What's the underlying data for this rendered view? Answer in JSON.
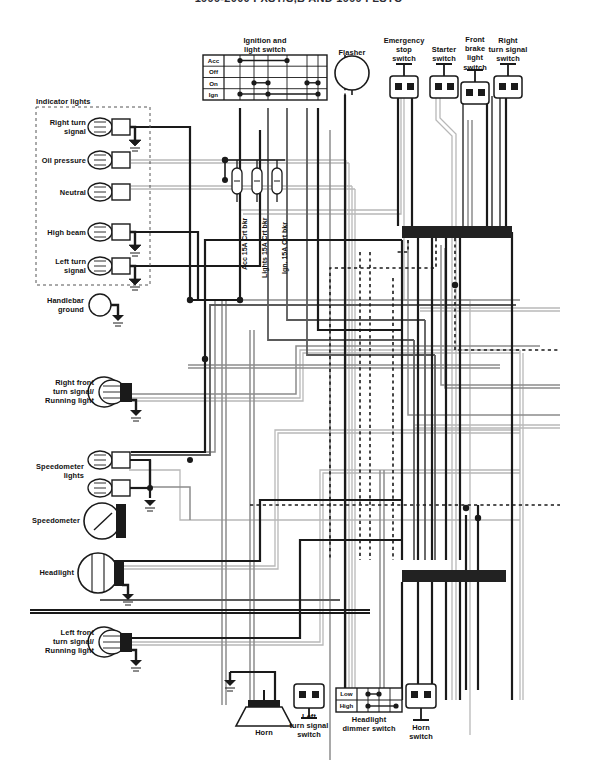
{
  "diagram": {
    "title": "1999-2000 FXST/S,B AND 1999 FLSTC",
    "type": "motorcycle-wiring-diagram",
    "width": 597,
    "height": 776
  },
  "colors": {
    "wire_black": "#1a1a1a",
    "wire_dark_gray": "#5a5a5a",
    "wire_mid_gray": "#8c8c8c",
    "wire_light_gray": "#b8b8b8",
    "connector_black": "#222222",
    "paper": "#ffffff",
    "title_gray": "#2b2b33"
  },
  "indicator_panel": {
    "title": "Indicator lights",
    "lamps": [
      {
        "label": "Right turn\nsignal",
        "grounded": true
      },
      {
        "label": "Oil pressure",
        "grounded": false
      },
      {
        "label": "Neutral",
        "grounded": false
      },
      {
        "label": "High beam",
        "grounded": true
      },
      {
        "label": "Left turn\nsignal",
        "grounded": true
      }
    ]
  },
  "ignition_switch": {
    "title": "Ignition and\nlight switch",
    "rows": [
      "Acc",
      "Off",
      "On",
      "Ign"
    ],
    "columns": 7,
    "contacts": {
      "Acc": [
        1,
        4
      ],
      "Off": [],
      "On": [
        2,
        3,
        6,
        7
      ],
      "Ign": [
        1,
        3,
        7
      ]
    }
  },
  "fuses": [
    {
      "label": "Acc 15A Crt bkr"
    },
    {
      "label": "Lights 15A Crt bkr"
    },
    {
      "label": "Ign. 15A Crt bkr"
    }
  ],
  "top_components": [
    {
      "label": "Flasher",
      "kind": "round"
    },
    {
      "label": "Emergency\nstop\nswitch",
      "kind": "2pin"
    },
    {
      "label": "Starter\nswitch",
      "kind": "2pin"
    },
    {
      "label": "Front\nbrake\nlight\nswitch",
      "kind": "2pin"
    },
    {
      "label": "Right\nturn signal\nswitch",
      "kind": "2pin"
    }
  ],
  "left_components": [
    {
      "label": "Handlebar\nground",
      "kind": "ground-circle"
    },
    {
      "label": "Right front\nturn signal/\nRunning light",
      "kind": "bulb-dual"
    },
    {
      "label": "Speedometer\nlights",
      "kind": "bulb-pair"
    },
    {
      "label": "Speedometer",
      "kind": "gauge"
    },
    {
      "label": "Headlight",
      "kind": "headlamp"
    },
    {
      "label": "Left front\nturn signal/\nRunning light",
      "kind": "bulb-dual"
    }
  ],
  "bottom_components": [
    {
      "label": "Horn",
      "kind": "horn"
    },
    {
      "label": "Left\nturn signal\nswitch",
      "kind": "2pin"
    },
    {
      "label": "Headlight\ndimmer switch",
      "kind": "matrix"
    },
    {
      "label": "Horn\nswitch",
      "kind": "2pin"
    }
  ],
  "dimmer_switch": {
    "rows": [
      "Low",
      "High"
    ],
    "columns": 4,
    "contacts": {
      "Low": [
        1,
        2
      ],
      "High": [
        1,
        4
      ]
    }
  },
  "connector_bars": [
    {
      "name": "upper-connector-bar",
      "x": 402,
      "y": 226,
      "width": 110,
      "height": 12
    },
    {
      "name": "lower-connector-bar",
      "x": 402,
      "y": 570,
      "width": 104,
      "height": 12
    }
  ]
}
